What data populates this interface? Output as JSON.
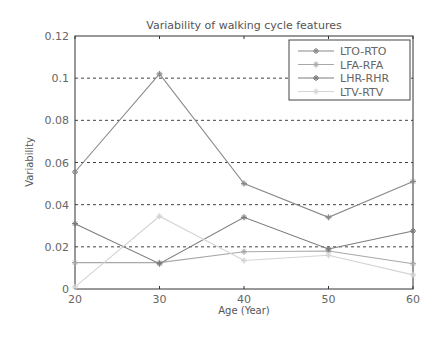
{
  "chart_data": {
    "type": "line",
    "title": "Variability of walking cycle features",
    "xlabel": "Age (Year)",
    "ylabel": "Variability",
    "x": [
      20,
      30,
      40,
      50,
      60
    ],
    "xlim": [
      20,
      60
    ],
    "ylim": [
      0,
      0.12
    ],
    "xticks": [
      "20",
      "30",
      "40",
      "50",
      "60"
    ],
    "yticks": [
      "0",
      "0.02",
      "0.04",
      "0.06",
      "0.08",
      "0.1",
      "0.12"
    ],
    "grid": "horizontal dashed",
    "legend_position": "upper right",
    "series": [
      {
        "name": "LTO-RTO",
        "color": "#8a8a8a",
        "values": [
          0.0555,
          0.102,
          0.05,
          0.034,
          0.051
        ]
      },
      {
        "name": "LFA-RFA",
        "color": "#a8a8a8",
        "values": [
          0.0125,
          0.0125,
          0.0177,
          0.018,
          0.012
        ]
      },
      {
        "name": "LHR-RHR",
        "color": "#7c7c7c",
        "values": [
          0.031,
          0.012,
          0.034,
          0.019,
          0.0275
        ]
      },
      {
        "name": "LTV-RTV",
        "color": "#d4d4d4",
        "values": [
          0.001,
          0.0345,
          0.0135,
          0.016,
          0.0067
        ]
      }
    ]
  }
}
